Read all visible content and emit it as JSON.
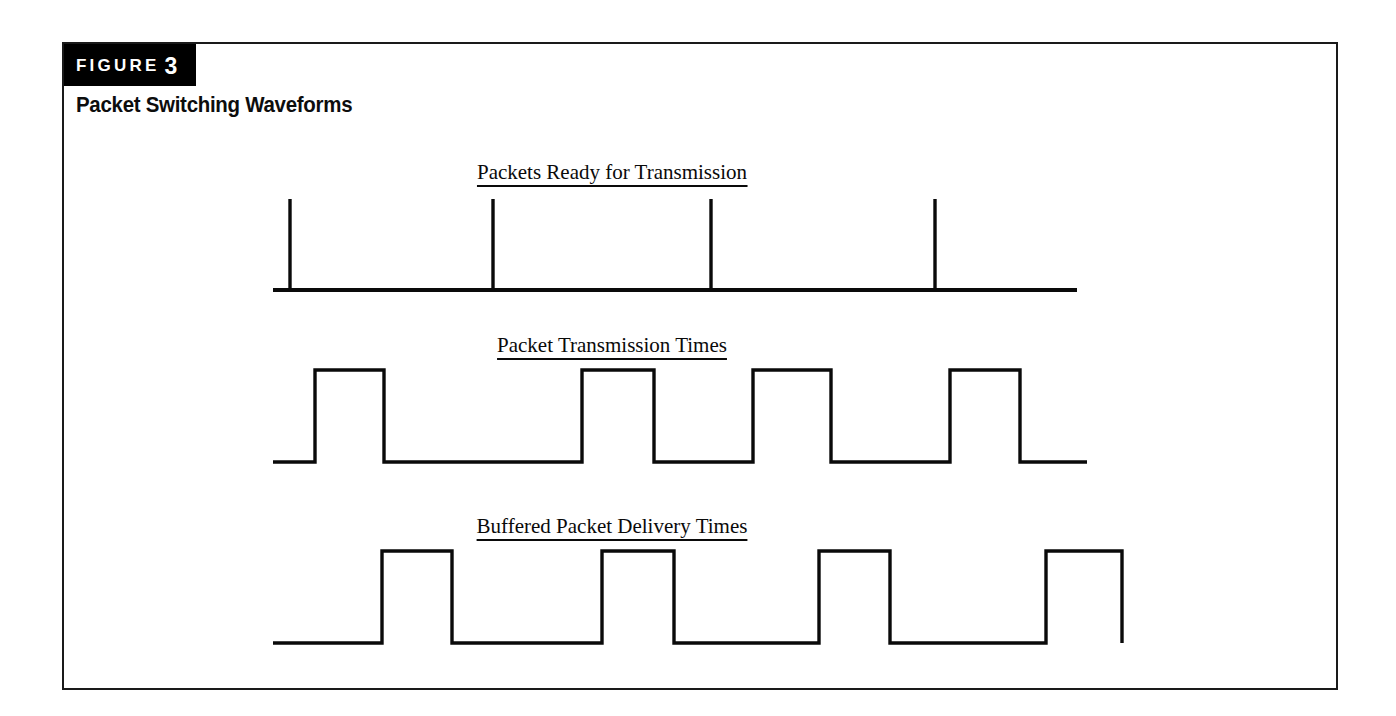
{
  "figure": {
    "badge_word": "FIGURE",
    "badge_number": "3",
    "title": "Packet Switching Waveforms",
    "accent_color": "#000000",
    "ink_color": "#0a0a0a",
    "background_color": "#ffffff"
  },
  "chart_data": {
    "type": "line",
    "title": "Packet Switching Waveforms",
    "subtitle": "",
    "xlabel": "",
    "ylabel": "",
    "grid": false,
    "legend": "none",
    "axis_ranges": {
      "x": [
        0,
        100
      ],
      "y": [
        0,
        1
      ]
    },
    "panels": [
      {
        "id": "packets-ready",
        "label": "Packets Ready for Transmission",
        "label_underlined": true,
        "waveform_type": "impulse",
        "baseline_start": 0.0,
        "baseline_end": 100.0,
        "impulses": [
          1.9,
          27.2,
          54.3,
          82.2
        ],
        "impulse_height": 1.0,
        "pulses": []
      },
      {
        "id": "packet-transmission",
        "label": "Packet Transmission Times",
        "label_underlined": true,
        "waveform_type": "pulse",
        "baseline_start": 0.0,
        "baseline_end": 100.0,
        "impulses": [],
        "pulses": [
          {
            "start": 5.0,
            "end": 13.5,
            "level": 1.0
          },
          {
            "start": 38.0,
            "end": 46.9,
            "level": 1.0
          },
          {
            "start": 59.0,
            "end": 68.6,
            "level": 1.0
          },
          {
            "start": 83.3,
            "end": 92.0,
            "level": 1.0
          }
        ]
      },
      {
        "id": "buffered-delivery",
        "label": "Buffered Packet Delivery Times",
        "label_underlined": true,
        "waveform_type": "pulse",
        "baseline_start": 0.0,
        "baseline_end": 100.0,
        "impulses": [],
        "pulses": [
          {
            "start": 13.3,
            "end": 21.8,
            "level": 1.0
          },
          {
            "start": 40.0,
            "end": 48.8,
            "level": 1.0
          },
          {
            "start": 66.4,
            "end": 75.0,
            "level": 1.0
          },
          {
            "start": 94.0,
            "end": 103.3,
            "level": 1.0
          }
        ]
      }
    ]
  }
}
